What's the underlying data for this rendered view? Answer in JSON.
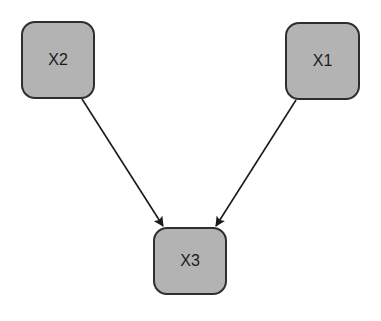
{
  "diagram": {
    "type": "directed-graph",
    "background": "#ffffff",
    "node_fill": "#b3b3b3",
    "node_stroke": "#2e2e2e",
    "edge_color": "#1a1a1a",
    "nodes": [
      {
        "id": "X2",
        "label": "X2",
        "x": 21,
        "y": 21,
        "w": 74,
        "h": 78
      },
      {
        "id": "X1",
        "label": "X1",
        "x": 285,
        "y": 22,
        "w": 75,
        "h": 78
      },
      {
        "id": "X3",
        "label": "X3",
        "x": 153,
        "y": 227,
        "w": 74,
        "h": 68
      }
    ],
    "edges": [
      {
        "from": "X2",
        "to": "X3",
        "x1": 82,
        "y1": 99,
        "x2": 163,
        "y2": 226
      },
      {
        "from": "X1",
        "to": "X3",
        "x1": 296,
        "y1": 100,
        "x2": 216,
        "y2": 226
      }
    ]
  }
}
